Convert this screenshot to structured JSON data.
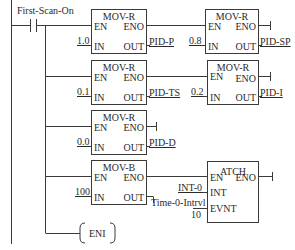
{
  "diagram": {
    "type": "ladder-logic",
    "contact": {
      "label": "First-Scan-On"
    },
    "blocks": [
      {
        "id": "b1",
        "name": "MOV-R",
        "pins": {
          "en": "EN",
          "eno": "ENO",
          "in": "IN",
          "out": "OUT"
        },
        "in_value": "1.0",
        "out_value": "PID-P"
      },
      {
        "id": "b2",
        "name": "MOV-R",
        "pins": {
          "en": "EN",
          "eno": "ENO",
          "in": "IN",
          "out": "OUT"
        },
        "in_value": "0.8",
        "out_value": "PID-SP"
      },
      {
        "id": "b3",
        "name": "MOV-R",
        "pins": {
          "en": "EN",
          "eno": "ENO",
          "in": "IN",
          "out": "OUT"
        },
        "in_value": "0.1",
        "out_value": "PID-TS"
      },
      {
        "id": "b4",
        "name": "MOV-R",
        "pins": {
          "en": "EN",
          "eno": "ENO",
          "in": "IN",
          "out": "OUT"
        },
        "in_value": "0.2",
        "out_value": "PID-I"
      },
      {
        "id": "b5",
        "name": "MOV-R",
        "pins": {
          "en": "EN",
          "eno": "ENO",
          "in": "IN",
          "out": "OUT"
        },
        "in_value": "0.0",
        "out_value": "PID-D"
      },
      {
        "id": "b6",
        "name": "MOV-B",
        "pins": {
          "en": "EN",
          "eno": "ENO",
          "in": "IN",
          "out": "OUT"
        },
        "in_value": "100",
        "out_value": "Time-0-Intrvl"
      },
      {
        "id": "b7",
        "name": "ATCH",
        "pins": {
          "en": "EN",
          "eno": "ENO",
          "int": "INT",
          "evnt": "EVNT"
        },
        "int_value": "INT-0",
        "evnt_value": "10"
      }
    ],
    "coil": {
      "label": "ENI"
    },
    "colors": {
      "line": "#3a3a3a",
      "background": "#ffffff"
    }
  }
}
